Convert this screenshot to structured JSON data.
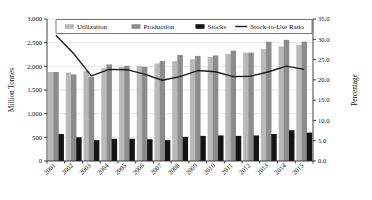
{
  "chart_data": {
    "type": "bar",
    "title": "",
    "subtitle": "",
    "xlabel": "",
    "ylabel": "Million Tonnes",
    "y2label": "Percentage",
    "categories": [
      "2001",
      "2002",
      "2003",
      "2004",
      "2005",
      "2006",
      "2007",
      "2008",
      "2009",
      "2010",
      "2011",
      "2012",
      "2013",
      "2014",
      "2015"
    ],
    "ylim": [
      0,
      3000
    ],
    "yticks": [
      0,
      500,
      1000,
      1500,
      2000,
      2500,
      3000
    ],
    "ytick_labels": [
      "0",
      "500",
      "1,000",
      "1,500",
      "2,000",
      "2,500",
      "3,000"
    ],
    "y2lim": [
      0,
      35
    ],
    "y2ticks": [
      0,
      5,
      10,
      15,
      20,
      25,
      30,
      35
    ],
    "y2tick_labels": [
      "0.0",
      "5.0",
      "10.0",
      "15.0",
      "20.0",
      "25.0",
      "30.0",
      "35.0"
    ],
    "grid": true,
    "legend_position": "top",
    "series": [
      {
        "name": "Utilization",
        "type": "bar",
        "axis": "left",
        "color": "#b9b9b9",
        "values": [
          1880,
          1870,
          1900,
          1960,
          1990,
          2010,
          2060,
          2110,
          2150,
          2200,
          2260,
          2290,
          2360,
          2420,
          2450
        ]
      },
      {
        "name": "Production",
        "type": "bar",
        "axis": "left",
        "color": "#8c8c8c",
        "values": [
          1880,
          1830,
          1780,
          2040,
          2010,
          1990,
          2110,
          2240,
          2220,
          2230,
          2330,
          2290,
          2520,
          2560,
          2520
        ]
      },
      {
        "name": "Stocks",
        "type": "bar",
        "axis": "left",
        "color": "#131313",
        "values": [
          570,
          500,
          440,
          470,
          470,
          460,
          440,
          510,
          530,
          540,
          530,
          540,
          570,
          650,
          600
        ]
      },
      {
        "name": "Stock-to-Use Ratio",
        "type": "line",
        "axis": "right",
        "color": "#1b1b1b",
        "values": [
          31.0,
          26.5,
          21.0,
          22.6,
          22.5,
          21.4,
          19.9,
          20.8,
          22.3,
          22.0,
          20.8,
          20.9,
          22.0,
          23.4,
          22.6
        ]
      }
    ]
  },
  "legend": {
    "items": [
      {
        "label": "Utilization",
        "marker": "swatch"
      },
      {
        "label": "Production",
        "marker": "swatch"
      },
      {
        "label": "Stocks",
        "marker": "swatch"
      },
      {
        "label": "Stock-to-Use Ratio",
        "marker": "line"
      }
    ]
  },
  "axes": {
    "left_title": "Million Tonnes",
    "right_title": "Percentage"
  }
}
